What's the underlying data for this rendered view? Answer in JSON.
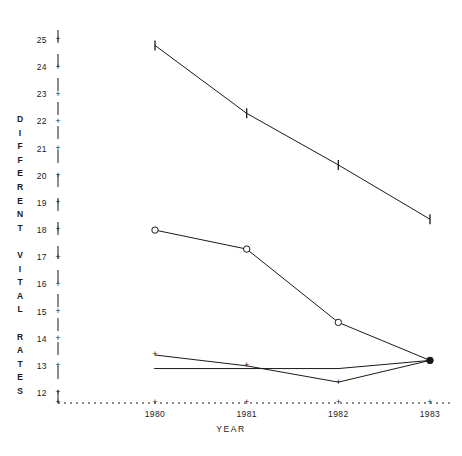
{
  "chart_data": {
    "type": "line",
    "title": "",
    "xlabel": "YEAR",
    "ylabel": "DIFFERENT VITAL RATES",
    "categories": [
      "1980",
      "1981",
      "1982",
      "1983"
    ],
    "x": [
      1980,
      1981,
      1982,
      1983
    ],
    "xlim": [
      1979.4,
      1983.6
    ],
    "ylim": [
      12,
      25
    ],
    "ytick_labels": [
      "25",
      "24",
      "23",
      "22",
      "21",
      "20",
      "19",
      "18",
      "17",
      "16",
      "15",
      "14",
      "13",
      "12"
    ],
    "yticks": [
      25,
      24,
      23,
      22,
      21,
      20,
      19,
      18,
      17,
      16,
      15,
      14,
      13,
      12
    ],
    "xtick_labels": [
      "1980",
      "1981",
      "1982",
      "1983"
    ],
    "grid": false,
    "legend": "none",
    "y_axis_style": "dashed-vertical-with-plus-ticks",
    "x_axis_style": "dotted-horizontal-with-plus-ticks",
    "series": [
      {
        "name": "series-bar",
        "marker": "I",
        "marker_name": "vertical-bar-marker",
        "values": [
          24.8,
          22.3,
          20.4,
          18.4
        ]
      },
      {
        "name": "series-circle",
        "marker": "o",
        "marker_name": "circle-marker",
        "values": [
          18.0,
          17.3,
          14.6,
          13.2
        ]
      },
      {
        "name": "series-plus",
        "marker": "+",
        "marker_name": "plus-marker",
        "values": [
          13.4,
          13.0,
          12.4,
          13.2
        ]
      },
      {
        "name": "series-dash",
        "marker": "-",
        "marker_name": "dash-marker",
        "values": [
          12.9,
          12.9,
          12.9,
          13.2
        ]
      }
    ],
    "colors": {
      "ink": "#1a1a1a",
      "background": "#ffffff"
    }
  }
}
